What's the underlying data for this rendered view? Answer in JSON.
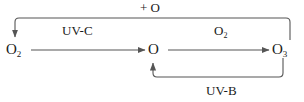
{
  "diagram": {
    "background_color": "#ffffff",
    "stroke_color": "#555555",
    "text_color": "#1a1a1a",
    "nodes": [
      {
        "id": "o2_left",
        "label": "O",
        "sub": "2",
        "name": "node-o2-left"
      },
      {
        "id": "o_center",
        "label": "O",
        "sub": "",
        "name": "node-o-center"
      },
      {
        "id": "o3_right",
        "label": "O",
        "sub": "3",
        "name": "node-o3-right"
      }
    ],
    "edges": [
      {
        "id": "e_o2_to_o",
        "from": "o2_left",
        "to": "o_center",
        "label": "UV-C",
        "label_sub": "",
        "direction": "right",
        "style": "straight"
      },
      {
        "id": "e_o_to_o3",
        "from": "o_center",
        "to": "o3_right",
        "label": "O",
        "label_sub": "2",
        "direction": "right",
        "style": "straight"
      },
      {
        "id": "e_o3_to_o2_top",
        "from": "o3_right",
        "to": "o2_left",
        "label": "+ O",
        "label_sub": "",
        "direction": "left",
        "style": "loop-top"
      },
      {
        "id": "e_o3_to_o_bottom",
        "from": "o3_right",
        "to": "o_center",
        "label": "UV-B",
        "label_sub": "",
        "direction": "left",
        "style": "loop-bottom"
      }
    ],
    "labels": {
      "uvc": "UV-C",
      "uvb": "UV-B",
      "plus_o": "+ O",
      "o2_over_right_arrow": "O",
      "o2_over_right_arrow_sub": "2",
      "o2_left_main": "O",
      "o2_left_sub": "2",
      "o_center_main": "O",
      "o3_right_main": "O",
      "o3_right_sub": "3"
    }
  }
}
